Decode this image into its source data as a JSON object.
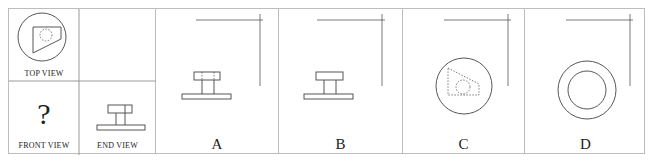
{
  "question": {
    "top_view_label": "TOP VIEW",
    "front_view_label": "FRONT VIEW",
    "end_view_label": "END VIEW",
    "unknown_mark": "?"
  },
  "options": [
    {
      "label": "A",
      "description": "front view with hidden lines in top block"
    },
    {
      "label": "B",
      "description": "front view without hidden lines"
    },
    {
      "label": "C",
      "description": "circle with dashed trapezoid and dashed circle"
    },
    {
      "label": "D",
      "description": "two concentric circles"
    }
  ],
  "colors": {
    "line": "#444444",
    "border": "#bdbdbd",
    "text": "#222222"
  }
}
